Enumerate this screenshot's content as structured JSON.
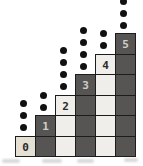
{
  "figure": {
    "type": "staircase-dot-diagram",
    "background": "#ffffff",
    "grid": {
      "origin_x": 15,
      "top_y": 33,
      "cell_w": 20,
      "cell_h": 20.5,
      "rows": 6,
      "border_color": "#1c1c1c",
      "dark_cell_color": "#575553",
      "light_cell_color": "#efeeea",
      "zero_cell_color": "#e5e0d4",
      "number_text_on_dark": "#cfcfcf",
      "number_text_on_light": "#2a2a2a"
    },
    "dot": {
      "color": "#111111",
      "diameter": 7,
      "spacing": 12,
      "gap_above_cell": 8,
      "x_offset": -2
    },
    "columns": [
      {
        "label": "0",
        "cells": 1,
        "dots": 3,
        "shade": "light"
      },
      {
        "label": "1",
        "cells": 2,
        "dots": 2,
        "shade": "dark"
      },
      {
        "label": "2",
        "cells": 3,
        "dots": 4,
        "shade": "light"
      },
      {
        "label": "3",
        "cells": 4,
        "dots": 4,
        "shade": "dark"
      },
      {
        "label": "4",
        "cells": 5,
        "dots": 2,
        "shade": "light"
      },
      {
        "label": "5",
        "cells": 6,
        "dots": 3,
        "shade": "dark"
      }
    ]
  }
}
